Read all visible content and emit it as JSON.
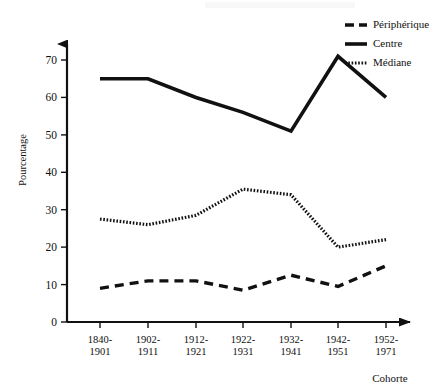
{
  "chart_data": {
    "type": "line",
    "title": "",
    "xlabel": "Cohorte",
    "ylabel": "Pourcentage",
    "categories": [
      "1840-\n1901",
      "1902-\n1911",
      "1912-\n1921",
      "1922-\n1931",
      "1932-\n1941",
      "1942-\n1951",
      "1952-\n1971"
    ],
    "category_lines": [
      [
        "1840-",
        "1901"
      ],
      [
        "1902-",
        "1911"
      ],
      [
        "1912-",
        "1921"
      ],
      [
        "1922-",
        "1931"
      ],
      [
        "1932-",
        "1941"
      ],
      [
        "1942-",
        "1951"
      ],
      [
        "1952-",
        "1971"
      ]
    ],
    "ylim": [
      0,
      75
    ],
    "yticks": [
      0,
      10,
      20,
      30,
      40,
      50,
      60,
      70
    ],
    "ytick_labels": [
      "0",
      "10",
      "20",
      "30",
      "40",
      "50",
      "60",
      "70"
    ],
    "grid": false,
    "legend_position": "top-right",
    "series": [
      {
        "name": "Périphérique",
        "style": "dashed",
        "color": "#111111",
        "values": [
          9,
          11,
          11,
          8.5,
          12.5,
          9.5,
          15
        ]
      },
      {
        "name": "Centre",
        "style": "solid",
        "color": "#111111",
        "values": [
          65,
          65,
          60,
          56,
          51,
          71,
          60
        ]
      },
      {
        "name": "Médiane",
        "style": "dotted",
        "color": "#111111",
        "values": [
          27.5,
          26,
          28.5,
          35.5,
          34,
          20,
          22
        ]
      }
    ]
  },
  "legend": {
    "items": [
      {
        "label": "Périphérique",
        "style": "dashed"
      },
      {
        "label": "Centre",
        "style": "solid"
      },
      {
        "label": "Médiane",
        "style": "dotted"
      }
    ]
  },
  "axes": {
    "y_axis_label": "Pourcentage",
    "x_axis_label": "Cohorte"
  }
}
